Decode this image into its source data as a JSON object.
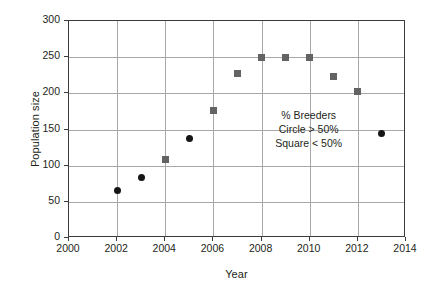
{
  "chart_data": {
    "type": "scatter",
    "title": "",
    "xlabel": "Year",
    "ylabel": "Population size",
    "xlim": [
      2000,
      2014
    ],
    "ylim": [
      0,
      300
    ],
    "xticks": [
      2000,
      2002,
      2004,
      2006,
      2008,
      2010,
      2012,
      2014
    ],
    "yticks": [
      0,
      50,
      100,
      150,
      200,
      250,
      300
    ],
    "xtick_labels": [
      "2000",
      "2002",
      "2004",
      "2006",
      "2008",
      "2010",
      "2012",
      "2014"
    ],
    "ytick_labels": [
      "0",
      "50",
      "100",
      "150",
      "200",
      "250",
      "300"
    ],
    "grid": {
      "horizontal": [
        50,
        100,
        150,
        200,
        250
      ],
      "vertical": [
        2002,
        2004,
        2006,
        2008,
        2010,
        2012
      ],
      "color": "#a8a8a8"
    },
    "legend": null,
    "legend_position": "none",
    "series": [
      {
        "name": "Circle > 50%",
        "marker": "circle",
        "color": "#151515",
        "points": [
          {
            "x": 2002,
            "y": 65
          },
          {
            "x": 2003,
            "y": 83
          },
          {
            "x": 2005,
            "y": 137
          },
          {
            "x": 2013,
            "y": 144
          }
        ]
      },
      {
        "name": "Square < 50%",
        "marker": "square",
        "color": "#636363",
        "points": [
          {
            "x": 2004,
            "y": 108
          },
          {
            "x": 2006,
            "y": 176
          },
          {
            "x": 2007,
            "y": 227
          },
          {
            "x": 2008,
            "y": 250
          },
          {
            "x": 2009,
            "y": 250
          },
          {
            "x": 2010,
            "y": 250
          },
          {
            "x": 2011,
            "y": 223
          },
          {
            "x": 2012,
            "y": 202
          }
        ]
      }
    ],
    "annotations": [
      {
        "x": 2010,
        "y": 150,
        "lines": [
          "% Breeders",
          "Circle > 50%",
          "Square < 50%"
        ]
      }
    ]
  },
  "figure": {
    "background": "#ffffff",
    "axis_color": "#3b3b3b",
    "text_color": "#231f20"
  }
}
